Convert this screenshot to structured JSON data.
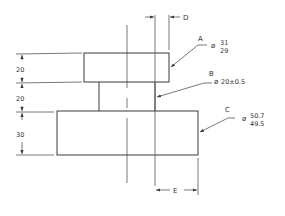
{
  "drawing": {
    "type": "stepped shaft engineering drawing",
    "labels": {
      "a": "A",
      "b": "B",
      "c": "C",
      "d": "D",
      "e": "E"
    },
    "diameter_symbol": "ø",
    "callouts": {
      "a_upper": "31",
      "a_lower": "29",
      "b_value": "20±0.5",
      "c_upper": "50.7",
      "c_lower": "49.5"
    },
    "heights": {
      "top": "20",
      "middle": "20",
      "bottom": "30"
    },
    "colors": {
      "line": "#3a3a3a",
      "background": "#ffffff"
    }
  }
}
